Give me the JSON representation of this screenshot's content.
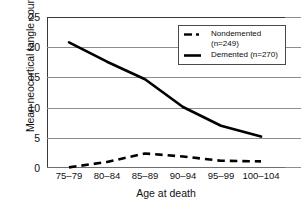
{
  "chart_data": {
    "type": "line",
    "title": "",
    "xlabel": "Age at death",
    "ylabel": "Mean neocortical tangle count",
    "categories": [
      "75–79",
      "80–84",
      "85–89",
      "90–94",
      "95–99",
      "100–104"
    ],
    "ylim": [
      0,
      25
    ],
    "yticks": [
      25,
      20,
      15,
      10,
      5,
      0
    ],
    "grid": true,
    "legend_position": "top-right",
    "series": [
      {
        "name": "Nondemented (n=249)",
        "label_line1": "Nondemented",
        "label_line2": "(n=249)",
        "style": "dashed",
        "color": "#000000",
        "values": [
          0.1,
          1.0,
          2.4,
          1.9,
          1.2,
          1.1
        ]
      },
      {
        "name": "Demented (n=270)",
        "label_line1": "Demented (n=270)",
        "label_line2": "",
        "style": "solid",
        "color": "#000000",
        "values": [
          20.8,
          17.6,
          14.7,
          10.1,
          7.0,
          5.2
        ]
      }
    ]
  },
  "legend": {
    "entries": [
      {
        "text": "Nondemented\n(n=249)",
        "marker": "dashed-line-marker"
      },
      {
        "text": "Demented (n=270)",
        "marker": "solid-line-marker"
      }
    ]
  },
  "axes": {
    "y_tick_labels": [
      "25",
      "20",
      "15",
      "10",
      "5",
      "0"
    ],
    "x_tick_labels": [
      "75–79",
      "80–84",
      "85–89",
      "90–94",
      "95–99",
      "100–104"
    ],
    "y_axis_title": "Mean neocortical tangle count",
    "x_axis_title": "Age at death"
  }
}
